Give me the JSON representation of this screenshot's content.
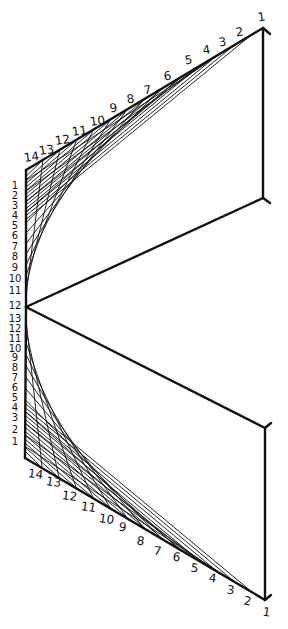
{
  "diagram": {
    "title": "",
    "colors": {
      "ink": "#111111",
      "background": "#ffffff"
    },
    "points": {
      "top_apex": [
        263,
        28
      ],
      "upper_corner": [
        26,
        170
      ],
      "center_vertex": [
        26,
        307
      ],
      "upper_right_foot": [
        263,
        198
      ],
      "lower_right_head": [
        265,
        428
      ],
      "lower_corner": [
        25,
        458
      ],
      "bottom_apex": [
        265,
        600
      ]
    },
    "top_edge_labels": [
      "1",
      "2",
      "3",
      "4",
      "5",
      "6",
      "7",
      "8",
      "9",
      "10",
      "11",
      "12",
      "13",
      "14"
    ],
    "upper_left_labels": [
      "1",
      "2",
      "3",
      "4",
      "5",
      "6",
      "7",
      "8",
      "9",
      "10",
      "11",
      "12"
    ],
    "lower_left_labels": [
      "13",
      "12",
      "11",
      "10",
      "9",
      "8",
      "7",
      "6",
      "5",
      "4",
      "3",
      "2",
      "1"
    ],
    "bottom_edge_labels": [
      "14",
      "13",
      "12",
      "11",
      "10",
      "9",
      "8",
      "7",
      "6",
      "5",
      "4",
      "3",
      "2",
      "1"
    ]
  }
}
